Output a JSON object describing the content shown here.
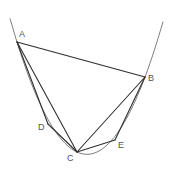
{
  "diagram": {
    "title": "",
    "curve": {
      "type": "parabola",
      "color": "#6e6e6e",
      "equation_screen": {
        "a": -0.02294,
        "b": 3.9897,
        "c": -19.19
      },
      "x_start": 10,
      "x_end": 163
    },
    "points": [
      {
        "id": "A",
        "label": "A",
        "x": 17,
        "y": 42,
        "label_x": 19,
        "label_y": 37
      },
      {
        "id": "B",
        "label": "B",
        "x": 145,
        "y": 77,
        "label_x": 148,
        "label_y": 81
      },
      {
        "id": "C",
        "label": "C",
        "x": 77,
        "y": 152,
        "label_x": 67,
        "label_y": 161
      },
      {
        "id": "D",
        "label": "D",
        "x": 48,
        "y": 124,
        "label_x": 38,
        "label_y": 130
      },
      {
        "id": "E",
        "label": "E",
        "x": 115,
        "y": 140,
        "label_x": 118,
        "label_y": 148
      }
    ],
    "segments": [
      {
        "from": "A",
        "to": "B"
      },
      {
        "from": "A",
        "to": "C"
      },
      {
        "from": "B",
        "to": "C"
      },
      {
        "from": "A",
        "to": "D"
      },
      {
        "from": "D",
        "to": "C"
      },
      {
        "from": "B",
        "to": "E"
      },
      {
        "from": "E",
        "to": "C"
      }
    ],
    "line_color": "#2f2f2f",
    "label_color": "#555555"
  }
}
